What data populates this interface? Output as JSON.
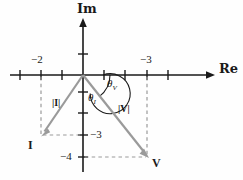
{
  "figure": {
    "type": "phasor-diagram",
    "axes": {
      "real_label": "Re",
      "imag_label": "Im",
      "real_tick_labels": [
        {
          "text": "−2",
          "value": -2,
          "side": "left"
        },
        {
          "text": "−3",
          "value": 3,
          "side": "right"
        }
      ],
      "imag_tick_labels": [
        {
          "text": "−3",
          "value": -3
        },
        {
          "text": "−4",
          "value": -4
        }
      ]
    },
    "phasors": [
      {
        "name": "I",
        "label": "I",
        "magnitude_label": "|I|",
        "angle_label": "θ",
        "angle_subscript": "I",
        "real": -2,
        "imag": -3,
        "color": "#9a9a9a"
      },
      {
        "name": "V",
        "label": "V",
        "magnitude_label": "|V|",
        "angle_label": "θ",
        "angle_subscript": "V",
        "real": 3,
        "imag": -4,
        "color": "#9a9a9a"
      }
    ],
    "colors": {
      "axis": "#1a1a1a",
      "phasor": "#9a9a9a",
      "dashed": "#9a9a9a",
      "text": "#1a1a1a",
      "background": "#fefefe"
    }
  }
}
